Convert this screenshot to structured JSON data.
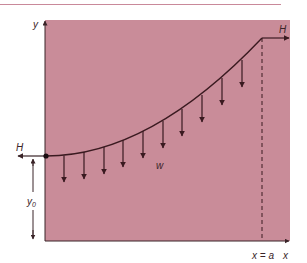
{
  "diagram": {
    "title": "",
    "colors": {
      "background": "#c98c99",
      "curve": "#3a1a20",
      "arrow": "#3a1a20",
      "rule": "#c9899a"
    },
    "labels": {
      "y_axis": "y",
      "x_axis": "x",
      "tension_left": "H",
      "tension_right": "H",
      "load": "w",
      "y0": "y",
      "y0_sub": "0",
      "x_end": "x = a"
    },
    "load_arrow_count": 10
  }
}
